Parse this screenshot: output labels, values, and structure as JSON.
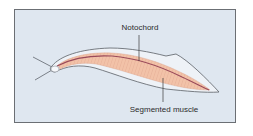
{
  "figure": {
    "type": "anatomical-illustration",
    "labels": {
      "notochord": "Notochord",
      "segmented_muscle": "Segmented muscle"
    },
    "colors": {
      "panel_background": "#dfe7f0",
      "panel_border": "#6b6f74",
      "body_outline": "#5a5f66",
      "fin": "#eef2f7",
      "muscle": "#f2c2a8",
      "muscle_stripe": "#d99a84",
      "notochord": "#9a4a5a",
      "leader_line": "#3a3a3a"
    }
  }
}
